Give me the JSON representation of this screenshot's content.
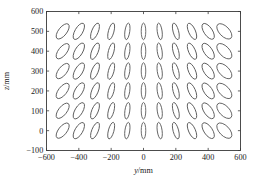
{
  "chart_data": {
    "type": "scatter",
    "title": "",
    "subtitle": "",
    "xlabel": "y/mm",
    "ylabel": "z/mm",
    "xlim": [
      -600,
      600
    ],
    "ylim": [
      -100,
      600
    ],
    "xticks": [
      -600,
      -400,
      -200,
      0,
      200,
      400,
      600
    ],
    "xtick_labels": [
      "−600",
      "−400",
      "−200",
      "0",
      "200",
      "400",
      "600"
    ],
    "yticks": [
      -100,
      0,
      100,
      200,
      300,
      400,
      500,
      600
    ],
    "ytick_labels": [
      "−100",
      "0",
      "100",
      "200",
      "300",
      "400",
      "500",
      "600"
    ],
    "grid": false,
    "legend": null,
    "annotations": [],
    "marker_type": "ellipse",
    "grid_y_values": [
      -500,
      -400,
      -300,
      -200,
      -100,
      0,
      100,
      200,
      300,
      400,
      500
    ],
    "grid_z_values": [
      0,
      100,
      200,
      300,
      400,
      500
    ],
    "ellipses": [
      {
        "y": -500,
        "z": 500,
        "semi_major": 46,
        "semi_minor": 26,
        "tilt_deg": 38
      },
      {
        "y": -400,
        "z": 500,
        "semi_major": 46,
        "semi_minor": 24,
        "tilt_deg": 30
      },
      {
        "y": -300,
        "z": 500,
        "semi_major": 44,
        "semi_minor": 20,
        "tilt_deg": 22
      },
      {
        "y": -200,
        "z": 500,
        "semi_major": 43,
        "semi_minor": 17,
        "tilt_deg": 15
      },
      {
        "y": -100,
        "z": 500,
        "semi_major": 42,
        "semi_minor": 15,
        "tilt_deg": 8
      },
      {
        "y": 0,
        "z": 500,
        "semi_major": 42,
        "semi_minor": 14,
        "tilt_deg": 0
      },
      {
        "y": 100,
        "z": 500,
        "semi_major": 42,
        "semi_minor": 15,
        "tilt_deg": -8
      },
      {
        "y": 200,
        "z": 500,
        "semi_major": 43,
        "semi_minor": 17,
        "tilt_deg": -15
      },
      {
        "y": 300,
        "z": 500,
        "semi_major": 44,
        "semi_minor": 21,
        "tilt_deg": -24
      },
      {
        "y": 400,
        "z": 500,
        "semi_major": 46,
        "semi_minor": 26,
        "tilt_deg": -34
      },
      {
        "y": 500,
        "z": 500,
        "semi_major": 48,
        "semi_minor": 31,
        "tilt_deg": -44
      },
      {
        "y": -500,
        "z": 400,
        "semi_major": 46,
        "semi_minor": 26,
        "tilt_deg": 38
      },
      {
        "y": -400,
        "z": 400,
        "semi_major": 46,
        "semi_minor": 24,
        "tilt_deg": 30
      },
      {
        "y": -300,
        "z": 400,
        "semi_major": 44,
        "semi_minor": 20,
        "tilt_deg": 22
      },
      {
        "y": -200,
        "z": 400,
        "semi_major": 43,
        "semi_minor": 17,
        "tilt_deg": 15
      },
      {
        "y": -100,
        "z": 400,
        "semi_major": 42,
        "semi_minor": 15,
        "tilt_deg": 8
      },
      {
        "y": 0,
        "z": 400,
        "semi_major": 42,
        "semi_minor": 14,
        "tilt_deg": 0
      },
      {
        "y": 100,
        "z": 400,
        "semi_major": 42,
        "semi_minor": 15,
        "tilt_deg": -8
      },
      {
        "y": 200,
        "z": 400,
        "semi_major": 43,
        "semi_minor": 17,
        "tilt_deg": -15
      },
      {
        "y": 300,
        "z": 400,
        "semi_major": 44,
        "semi_minor": 21,
        "tilt_deg": -24
      },
      {
        "y": 400,
        "z": 400,
        "semi_major": 46,
        "semi_minor": 26,
        "tilt_deg": -34
      },
      {
        "y": 500,
        "z": 400,
        "semi_major": 48,
        "semi_minor": 31,
        "tilt_deg": -44
      },
      {
        "y": -500,
        "z": 300,
        "semi_major": 46,
        "semi_minor": 26,
        "tilt_deg": 38
      },
      {
        "y": -400,
        "z": 300,
        "semi_major": 46,
        "semi_minor": 24,
        "tilt_deg": 30
      },
      {
        "y": -300,
        "z": 300,
        "semi_major": 44,
        "semi_minor": 20,
        "tilt_deg": 22
      },
      {
        "y": -200,
        "z": 300,
        "semi_major": 43,
        "semi_minor": 17,
        "tilt_deg": 15
      },
      {
        "y": -100,
        "z": 300,
        "semi_major": 42,
        "semi_minor": 15,
        "tilt_deg": 8
      },
      {
        "y": 0,
        "z": 300,
        "semi_major": 42,
        "semi_minor": 14,
        "tilt_deg": 0
      },
      {
        "y": 100,
        "z": 300,
        "semi_major": 42,
        "semi_minor": 15,
        "tilt_deg": -8
      },
      {
        "y": 200,
        "z": 300,
        "semi_major": 43,
        "semi_minor": 17,
        "tilt_deg": -15
      },
      {
        "y": 300,
        "z": 300,
        "semi_major": 44,
        "semi_minor": 21,
        "tilt_deg": -24
      },
      {
        "y": 400,
        "z": 300,
        "semi_major": 46,
        "semi_minor": 26,
        "tilt_deg": -34
      },
      {
        "y": 500,
        "z": 300,
        "semi_major": 48,
        "semi_minor": 31,
        "tilt_deg": -44
      },
      {
        "y": -500,
        "z": 200,
        "semi_major": 46,
        "semi_minor": 26,
        "tilt_deg": 38
      },
      {
        "y": -400,
        "z": 200,
        "semi_major": 46,
        "semi_minor": 24,
        "tilt_deg": 30
      },
      {
        "y": -300,
        "z": 200,
        "semi_major": 44,
        "semi_minor": 20,
        "tilt_deg": 22
      },
      {
        "y": -200,
        "z": 200,
        "semi_major": 43,
        "semi_minor": 17,
        "tilt_deg": 15
      },
      {
        "y": -100,
        "z": 200,
        "semi_major": 42,
        "semi_minor": 15,
        "tilt_deg": 8
      },
      {
        "y": 0,
        "z": 200,
        "semi_major": 42,
        "semi_minor": 14,
        "tilt_deg": 0
      },
      {
        "y": 100,
        "z": 200,
        "semi_major": 42,
        "semi_minor": 15,
        "tilt_deg": -8
      },
      {
        "y": 200,
        "z": 200,
        "semi_major": 43,
        "semi_minor": 17,
        "tilt_deg": -15
      },
      {
        "y": 300,
        "z": 200,
        "semi_major": 44,
        "semi_minor": 21,
        "tilt_deg": -24
      },
      {
        "y": 400,
        "z": 200,
        "semi_major": 46,
        "semi_minor": 26,
        "tilt_deg": -34
      },
      {
        "y": 500,
        "z": 200,
        "semi_major": 48,
        "semi_minor": 31,
        "tilt_deg": -44
      },
      {
        "y": -500,
        "z": 100,
        "semi_major": 46,
        "semi_minor": 26,
        "tilt_deg": 38
      },
      {
        "y": -400,
        "z": 100,
        "semi_major": 46,
        "semi_minor": 24,
        "tilt_deg": 30
      },
      {
        "y": -300,
        "z": 100,
        "semi_major": 44,
        "semi_minor": 20,
        "tilt_deg": 22
      },
      {
        "y": -200,
        "z": 100,
        "semi_major": 43,
        "semi_minor": 17,
        "tilt_deg": 15
      },
      {
        "y": -100,
        "z": 100,
        "semi_major": 42,
        "semi_minor": 15,
        "tilt_deg": 8
      },
      {
        "y": 0,
        "z": 100,
        "semi_major": 42,
        "semi_minor": 14,
        "tilt_deg": 0
      },
      {
        "y": 100,
        "z": 100,
        "semi_major": 42,
        "semi_minor": 15,
        "tilt_deg": -8
      },
      {
        "y": 200,
        "z": 100,
        "semi_major": 43,
        "semi_minor": 17,
        "tilt_deg": -15
      },
      {
        "y": 300,
        "z": 100,
        "semi_major": 44,
        "semi_minor": 21,
        "tilt_deg": -24
      },
      {
        "y": 400,
        "z": 100,
        "semi_major": 46,
        "semi_minor": 26,
        "tilt_deg": -34
      },
      {
        "y": 500,
        "z": 100,
        "semi_major": 48,
        "semi_minor": 31,
        "tilt_deg": -44
      },
      {
        "y": -500,
        "z": 0,
        "semi_major": 46,
        "semi_minor": 26,
        "tilt_deg": 38
      },
      {
        "y": -400,
        "z": 0,
        "semi_major": 46,
        "semi_minor": 24,
        "tilt_deg": 30
      },
      {
        "y": -300,
        "z": 0,
        "semi_major": 44,
        "semi_minor": 20,
        "tilt_deg": 22
      },
      {
        "y": -200,
        "z": 0,
        "semi_major": 43,
        "semi_minor": 17,
        "tilt_deg": 15
      },
      {
        "y": -100,
        "z": 0,
        "semi_major": 42,
        "semi_minor": 15,
        "tilt_deg": 8
      },
      {
        "y": 0,
        "z": 0,
        "semi_major": 42,
        "semi_minor": 14,
        "tilt_deg": 0
      },
      {
        "y": 100,
        "z": 0,
        "semi_major": 42,
        "semi_minor": 15,
        "tilt_deg": -8
      },
      {
        "y": 200,
        "z": 0,
        "semi_major": 43,
        "semi_minor": 17,
        "tilt_deg": -15
      },
      {
        "y": 300,
        "z": 0,
        "semi_major": 44,
        "semi_minor": 21,
        "tilt_deg": -24
      },
      {
        "y": 400,
        "z": 0,
        "semi_major": 46,
        "semi_minor": 26,
        "tilt_deg": -34
      },
      {
        "y": 500,
        "z": 0,
        "semi_major": 48,
        "semi_minor": 31,
        "tilt_deg": -44
      }
    ]
  },
  "colors": {
    "background": "#ffffff",
    "axis": "#3a3a3a",
    "curve": "#555555",
    "text": "#1a1a1a"
  }
}
